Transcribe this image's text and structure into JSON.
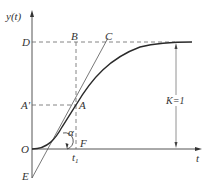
{
  "diagram": {
    "axis_labels": {
      "y": "y(t)",
      "x": "t"
    },
    "points": {
      "O": "O",
      "D": "D",
      "B": "B",
      "C": "C",
      "A": "A",
      "A_prime": "A'",
      "E": "E",
      "F": "F",
      "t1": "t",
      "t1_sub": "1"
    },
    "angle_label": "α",
    "gain_label": "K=1",
    "colors": {
      "curve": "#2a2a2a",
      "lines": "#555555",
      "dashed": "#666666"
    }
  }
}
